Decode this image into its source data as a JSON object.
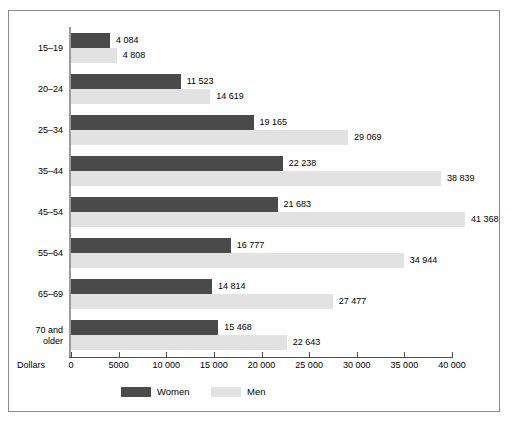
{
  "chart_data": {
    "type": "bar",
    "orientation": "horizontal",
    "title": "",
    "xlabel": "Dollars",
    "ylabel": "",
    "xlim": [
      0,
      40000
    ],
    "grid": false,
    "legend_position": "bottom",
    "tick_labels": [
      "0",
      "5000",
      "10 000",
      "15 000",
      "20 000",
      "25 000",
      "30 000",
      "35 000",
      "40 000"
    ],
    "tick_values": [
      0,
      5000,
      10000,
      15000,
      20000,
      25000,
      30000,
      35000,
      40000
    ],
    "categories": [
      "15–19",
      "20–24",
      "25–34",
      "35–44",
      "45–54",
      "55–64",
      "65–69",
      "70 and older"
    ],
    "series": [
      {
        "name": "Women",
        "color": "#4a4a4a",
        "values": [
          4084,
          11523,
          19165,
          22238,
          21683,
          16777,
          14814,
          15468
        ],
        "labels": [
          "4 084",
          "11 523",
          "19 165",
          "22 238",
          "21 683",
          "16 777",
          "14 814",
          "15 468"
        ]
      },
      {
        "name": "Men",
        "color": "#e2e2e2",
        "values": [
          4808,
          14619,
          29069,
          38839,
          41368,
          34944,
          27477,
          22643
        ],
        "labels": [
          "4 808",
          "14 619",
          "29 069",
          "38 839",
          "41 368",
          "34 944",
          "27 477",
          "22 643"
        ]
      }
    ]
  },
  "axis": {
    "dollars_label": "Dollars"
  },
  "legend": {
    "items": [
      {
        "label": "Women",
        "color": "#4a4a4a"
      },
      {
        "label": "Men",
        "color": "#e2e2e2"
      }
    ]
  }
}
